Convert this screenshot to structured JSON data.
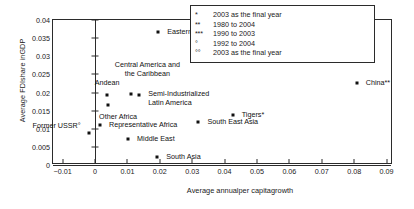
{
  "chart_data": {
    "type": "scatter",
    "title": "",
    "xlabel": "Average annualper capitagrowth",
    "ylabel": "Average FDIshare inGDP",
    "xlim": [
      -0.013,
      0.092
    ],
    "ylim": [
      0,
      0.04
    ],
    "xticks": [
      "-0.01",
      "0",
      "0.01",
      "0.02",
      "0.03",
      "0.04",
      "0.05",
      "0.06",
      "0.07",
      "0.08",
      "0.09"
    ],
    "xtick_values": [
      -0.01,
      0,
      0.01,
      0.02,
      0.03,
      0.04,
      0.05,
      0.06,
      0.07,
      0.08,
      0.09
    ],
    "yticks": [
      "0",
      "0.005",
      "0.01",
      "0.015",
      "0.02",
      "0.025",
      "0.03",
      "0.035",
      "0.04"
    ],
    "ytick_values": [
      0,
      0.005,
      0.01,
      0.015,
      0.02,
      0.025,
      0.03,
      0.035,
      0.04
    ],
    "grid": false,
    "legend_position": "top-right",
    "points": [
      {
        "label": "Eastern Europe***",
        "x": 0.0195,
        "y": 0.0368,
        "align": "l",
        "dx": 9,
        "dy": 0
      },
      {
        "label": "China**",
        "x": 0.0808,
        "y": 0.0225,
        "align": "l",
        "dx": 9,
        "dy": 0
      },
      {
        "label": "Central America and\nthe Caribbean",
        "x": 0.0112,
        "y": 0.0196,
        "align": "c",
        "dx": 16,
        "dy": -24
      },
      {
        "label": "Andean",
        "x": 0.0037,
        "y": 0.0194,
        "align": "c",
        "dx": 0,
        "dy": -12
      },
      {
        "label": "Semi-Industrialized\nLatin America",
        "x": 0.0136,
        "y": 0.0192,
        "align": "l",
        "dx": 9,
        "dy": 4
      },
      {
        "label": "Other Africa",
        "x": 0.004,
        "y": 0.0166,
        "align": "c",
        "dx": 10,
        "dy": 12
      },
      {
        "label": "Tigers*",
        "x": 0.0425,
        "y": 0.0139,
        "align": "l",
        "dx": 9,
        "dy": 0
      },
      {
        "label": "Representative Africa",
        "x": 0.0015,
        "y": 0.011,
        "align": "l",
        "dx": 9,
        "dy": 0
      },
      {
        "label": "South East Asia",
        "x": 0.0319,
        "y": 0.0118,
        "align": "l",
        "dx": 9,
        "dy": 0
      },
      {
        "label": "Former USSR°",
        "x": -0.002,
        "y": 0.0089,
        "align": "r",
        "dx": -8,
        "dy": -7
      },
      {
        "label": "Middle East",
        "x": 0.0102,
        "y": 0.0072,
        "align": "l",
        "dx": 9,
        "dy": 0
      },
      {
        "label": "South Asia",
        "x": 0.0192,
        "y": 0.0022,
        "align": "l",
        "dx": 9,
        "dy": 0
      }
    ]
  },
  "legend": {
    "rows": [
      {
        "mark": "*",
        "text": "2003 as the final year"
      },
      {
        "mark": "**",
        "text": "1980 to 2004"
      },
      {
        "mark": "***",
        "text": "1990 to 2003"
      },
      {
        "mark": "°",
        "text": "1992 to 2004"
      },
      {
        "mark": "°°",
        "text": "2003 as the final year"
      }
    ]
  }
}
